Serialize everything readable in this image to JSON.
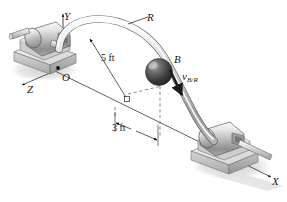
{
  "figure": {
    "background_color": "#ffffff",
    "line_color": "#1a1a1a",
    "metal_light": "#f2f2f2",
    "metal_mid": "#c8c8c8",
    "metal_dark": "#8a8a8a",
    "ball_dark": "#3a3a3a",
    "shadow_color": "#d8d8d8"
  },
  "axes": {
    "x_label": "X",
    "y_label": "Y",
    "z_label": "Z",
    "origin_label": "O"
  },
  "parts": {
    "rod_label": "R",
    "collar_label": "B"
  },
  "vector": {
    "symbol": "v",
    "subscript": "B/R",
    "name": "relative-velocity-of-B-with-respect-to-R"
  },
  "dimensions": {
    "vertical": "5 ft",
    "horizontal": "3 ft"
  }
}
